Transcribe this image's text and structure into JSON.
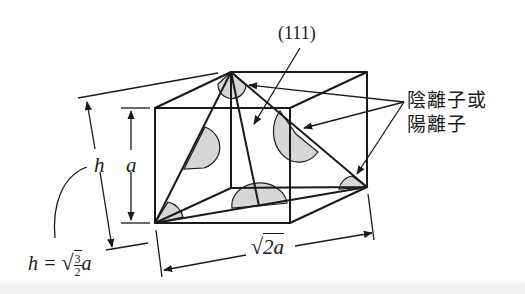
{
  "diagram": {
    "type": "crystal-structure",
    "colors": {
      "line": "#1a1a1a",
      "ion_fill": "#d6d6d6",
      "background": "#ffffff"
    }
  },
  "labels": {
    "miller_index": "(111)",
    "ions_line1": "陰離子或",
    "ions_line2": "陽離子",
    "height_symbol": "h",
    "edge_symbol": "a",
    "formula_lhs": "h = ",
    "formula_num": "3",
    "formula_den": "2",
    "formula_var": "a",
    "width_sqrt": "√",
    "width_value": "2a"
  },
  "dimensions": {
    "cube_edge": "a",
    "tetra_height": "h = √(3/2) a",
    "face_diagonal": "√2 a"
  }
}
